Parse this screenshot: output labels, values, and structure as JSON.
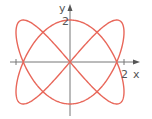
{
  "chart_data": {
    "type": "line",
    "title": "",
    "xlabel": "x",
    "ylabel": "y",
    "x_tick_labels": [
      "2"
    ],
    "y_tick_labels": [
      "2"
    ],
    "xlim": [
      -2.4,
      2.8
    ],
    "ylim": [
      -2.2,
      2.9
    ],
    "grid": false,
    "series": [
      {
        "name": "curve",
        "x_expr": "2*sin(2t)",
        "y_expr": "2*cos(3t)",
        "t_range": [
          0,
          6.2832
        ],
        "color": "#e8675a"
      }
    ]
  },
  "axes": {
    "x_label": "x",
    "y_label": "y",
    "x_tick": "2",
    "y_tick": "2",
    "axis_color": "#777777",
    "curve_color": "#e8675a"
  },
  "layout": {
    "origin_px": [
      70,
      62
    ],
    "x_scale_px": 27,
    "y_scale_px": 21
  }
}
